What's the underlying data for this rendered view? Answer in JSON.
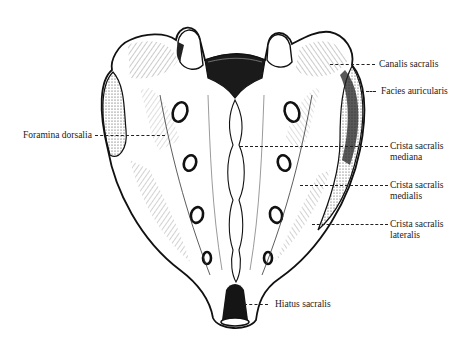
{
  "figure": {
    "labels": {
      "canalis_sacralis": "Canalis sacralis",
      "facies_auricularis": "Facies auricularis",
      "foramina_dorsalia": "Foramina dorsalia",
      "crista_mediana_1": "Crista sacralis",
      "crista_mediana_2": "mediana",
      "crista_medialis_1": "Crista sacralis",
      "crista_medialis_2": "medialis",
      "crista_lateralis_1": "Crista sacralis",
      "crista_lateralis_2": "lateralis",
      "hiatus_sacralis": "Hiatus sacralis"
    },
    "colors": {
      "ink": "#111111",
      "paper": "#ffffff",
      "stipple": "#555555"
    }
  }
}
